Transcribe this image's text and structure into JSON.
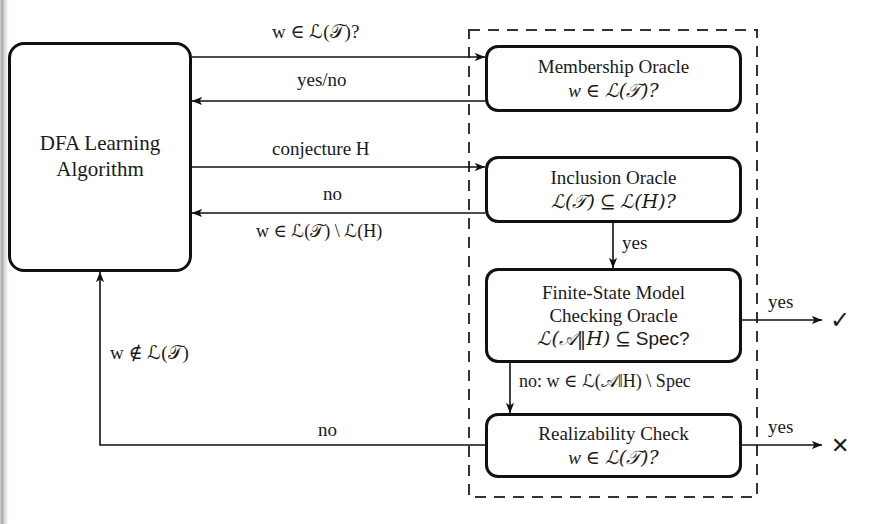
{
  "diagram": {
    "nodes": {
      "dfa": {
        "line1": "DFA Learning",
        "line2": "Algorithm"
      },
      "membership": {
        "line1": "Membership Oracle",
        "line2_a": "w",
        "line2_b": "∈",
        "line2_c": "ℒ(𝒯)?"
      },
      "inclusion": {
        "line1": "Inclusion Oracle",
        "line2_a": "ℒ(𝒯)",
        "line2_b": "⊆",
        "line2_c": "ℒ(H)?"
      },
      "fsm": {
        "line1": "Finite-State Model",
        "line2": "Checking Oracle",
        "line3_a": "ℒ(𝒜‖H)",
        "line3_b": "⊆",
        "line3_c": "Spec?"
      },
      "realizability": {
        "line1": "Realizability Check",
        "line2_a": "w",
        "line2_b": "∈",
        "line2_c": "ℒ(𝒯)?"
      }
    },
    "edge_labels": {
      "membership_query": "w ∈ ℒ(𝒯)?",
      "membership_answer": "yes/no",
      "conjecture": "conjecture H",
      "inclusion_no": "no",
      "inclusion_counterexample": "w ∈ ℒ(𝒯) \\ ℒ(H)",
      "inclusion_yes": "yes",
      "fsm_yes": "yes",
      "fsm_no": "no: w ∈ ℒ(𝒜‖H) \\ Spec",
      "realizability_yes": "yes",
      "realizability_no": "no",
      "realizability_feedback": "w ∉ ℒ(𝒯)"
    },
    "outcomes": {
      "success": "✓",
      "failure": "✕"
    },
    "group": {
      "name": "oracle-group-dashed-boundary"
    },
    "colors": {
      "stroke": "#111111",
      "text": "#1a1a1a",
      "background": "#ffffff",
      "dashed_stroke": "#333333"
    }
  }
}
